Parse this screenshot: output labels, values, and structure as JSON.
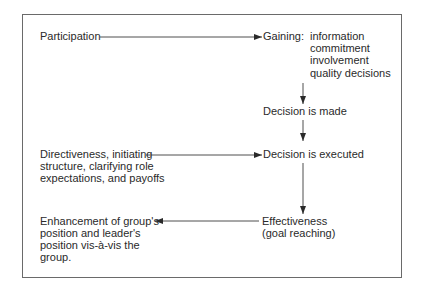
{
  "diagram": {
    "nodes": {
      "participation": "Participation",
      "gaining_label": "Gaining:",
      "gaining_items": [
        "information",
        "commitment",
        "involvement",
        "quality decisions"
      ],
      "decision_made": "Decision is made",
      "directiveness": [
        "Directiveness, initiating",
        "structure, clarifying role",
        "expectations, and payoffs"
      ],
      "decision_executed": "Decision is executed",
      "effectiveness": [
        "Effectiveness",
        "(goal reaching)"
      ],
      "enhancement": [
        "Enhancement of group's",
        "position and leader's",
        "position vis-à-vis the",
        "group."
      ]
    },
    "edges": [
      {
        "from": "Participation",
        "to": "Gaining"
      },
      {
        "from": "Gaining",
        "to": "Decision is made"
      },
      {
        "from": "Decision is made",
        "to": "Decision is executed"
      },
      {
        "from": "Directiveness",
        "to": "Decision is executed"
      },
      {
        "from": "Decision is executed",
        "to": "Effectiveness"
      },
      {
        "from": "Effectiveness",
        "to": "Enhancement"
      }
    ],
    "colors": {
      "line": "#3a3a3a",
      "frame": "#6a6a6a",
      "text": "#2a2a2a"
    }
  }
}
